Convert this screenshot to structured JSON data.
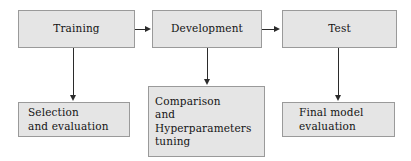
{
  "diagram": {
    "type": "flowchart",
    "orientation": "left-to-right pipeline with downward branches",
    "background_color": "#ffffff",
    "node_fill_color": "#e5e5e5",
    "node_border_color": "#9a9a9a",
    "text_color": "#141414",
    "arrow_color": "#2b2b2b",
    "nodes": [
      {
        "id": "training",
        "role": "stage",
        "lines": [
          "Training"
        ]
      },
      {
        "id": "development",
        "role": "stage",
        "lines": [
          "Development"
        ]
      },
      {
        "id": "test",
        "role": "stage",
        "lines": [
          "Test"
        ]
      },
      {
        "id": "selection",
        "role": "detail",
        "lines": [
          "Selection",
          "and evaluation"
        ]
      },
      {
        "id": "comparison",
        "role": "detail",
        "lines": [
          "Comparison",
          "and",
          "Hyperparameters",
          "tuning"
        ]
      },
      {
        "id": "final_model",
        "role": "detail",
        "lines": [
          "Final model",
          "evaluation"
        ]
      }
    ],
    "edges": [
      {
        "id": "training-development",
        "from": "training",
        "to": "development",
        "direction": "right"
      },
      {
        "id": "development-test",
        "from": "development",
        "to": "test",
        "direction": "right"
      },
      {
        "id": "training-selection",
        "from": "training",
        "to": "selection",
        "direction": "down"
      },
      {
        "id": "development-comparison",
        "from": "development",
        "to": "comparison",
        "direction": "down"
      },
      {
        "id": "test-final",
        "from": "test",
        "to": "final_model",
        "direction": "down"
      }
    ]
  }
}
